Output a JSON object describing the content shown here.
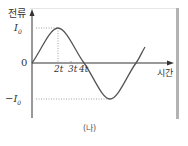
{
  "diagram": {
    "type": "sine-wave-graph",
    "y_axis_label": "전류",
    "x_axis_label": "시간",
    "origin_label": "0",
    "positive_peak_label": "I",
    "positive_peak_sub": "0",
    "negative_peak_label": "−I",
    "negative_peak_sub": "0",
    "x_ticks": [
      "2t",
      "3t",
      "4t"
    ],
    "caption": "(나)",
    "colors": {
      "curve": "#555555",
      "axis": "#333333",
      "frame": "#b3b3b3"
    }
  }
}
